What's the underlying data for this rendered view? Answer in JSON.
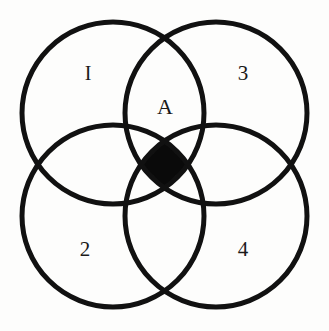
{
  "figure": {
    "background_color": "#fdfdfc",
    "stroke_color": "#111111",
    "fill_color": "#0a0a0a",
    "stroke_width": 5
  },
  "circles": [
    {
      "name": "top-left-circle",
      "cx": 113,
      "cy": 113,
      "r": 91
    },
    {
      "name": "top-right-circle",
      "cx": 216,
      "cy": 113,
      "r": 91
    },
    {
      "name": "bottom-left-circle",
      "cx": 113,
      "cy": 216,
      "r": 91
    },
    {
      "name": "bottom-right-circle",
      "cx": 216,
      "cy": 216,
      "r": 91
    }
  ],
  "labels": [
    {
      "id": "label-1",
      "text": "I",
      "x": 88,
      "y": 73,
      "style": "roman",
      "region": "top-left-lobe"
    },
    {
      "id": "label-3",
      "text": "3",
      "x": 243,
      "y": 73,
      "style": "numeral",
      "region": "top-right-lobe"
    },
    {
      "id": "label-a",
      "text": "A",
      "x": 165,
      "y": 107,
      "style": "center",
      "region": "central-intersection"
    },
    {
      "id": "label-2",
      "text": "2",
      "x": 85,
      "y": 249,
      "style": "numeral",
      "region": "bottom-left-lobe"
    },
    {
      "id": "label-4",
      "text": "4",
      "x": 243,
      "y": 249,
      "style": "numeral",
      "region": "bottom-right-lobe"
    }
  ],
  "shaded_region": {
    "name": "central-quadruple-intersection",
    "fill": "#0a0a0a",
    "label": "A",
    "description": "solid black astroid-shaped area where all four circles overlap"
  }
}
